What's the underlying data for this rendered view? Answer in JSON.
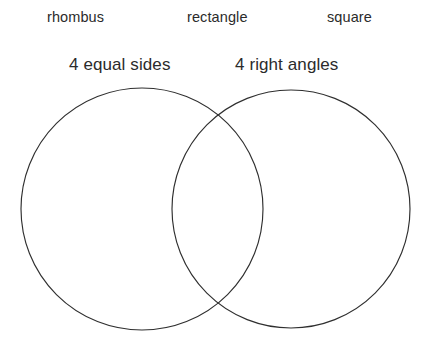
{
  "page": {
    "background_color": "#ffffff",
    "width": 436,
    "height": 347
  },
  "word_bank": {
    "items": [
      {
        "label": "rhombus"
      },
      {
        "label": "rectangle"
      },
      {
        "label": "square"
      }
    ]
  },
  "venn": {
    "stroke_color": "#2f2f2f",
    "fill_color": "none",
    "left_set": {
      "label": "4 equal sides",
      "cx": 142,
      "cy": 209,
      "r": 121
    },
    "right_set": {
      "label": "4 right angles",
      "cx": 291,
      "cy": 209,
      "r": 119
    },
    "regions": {
      "left_only": "",
      "intersection": "",
      "right_only": ""
    }
  }
}
